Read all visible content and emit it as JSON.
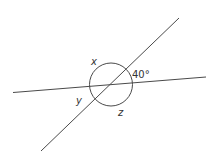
{
  "diagram": {
    "type": "intersecting-lines-angles",
    "labels": {
      "x": "x",
      "y": "y",
      "z": "z",
      "angle_given": "40°"
    },
    "given_angle_degrees": 40,
    "stroke_color": "#4a4a4a",
    "text_color": "#333333"
  }
}
